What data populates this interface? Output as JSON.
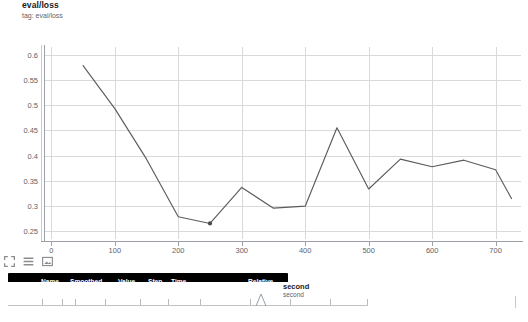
{
  "chart": {
    "title": "eval/loss",
    "subtitle": "tag: eval/loss"
  },
  "chart_data": {
    "type": "line",
    "title": "eval/loss",
    "subtitle": "tag: eval/loss",
    "xlabel": "",
    "ylabel": "",
    "xlim": [
      -10,
      740
    ],
    "ylim": [
      0.235,
      0.615
    ],
    "grid": true,
    "legend": false,
    "x_ticks": [
      0,
      100,
      200,
      300,
      400,
      500,
      600,
      700
    ],
    "y_ticks": [
      0.25,
      0.3,
      0.35,
      0.4,
      0.45,
      0.5,
      0.55,
      0.6
    ],
    "series": [
      {
        "name": "eval/loss",
        "color": "#5c5c5c",
        "x": [
          50,
          100,
          150,
          200,
          250,
          300,
          350,
          400,
          450,
          500,
          550,
          600,
          650,
          700,
          725
        ],
        "values": [
          0.578,
          0.493,
          0.393,
          0.279,
          0.2658,
          0.337,
          0.296,
          0.3,
          0.455,
          0.334,
          0.393,
          0.378,
          0.391,
          0.372,
          0.315
        ]
      }
    ],
    "highlight_point": {
      "x": 250,
      "y": 0.2658
    }
  },
  "tooltip": {
    "columns": [
      "Name",
      "Smoothed",
      "Value",
      "Step",
      "Time",
      "Relative"
    ],
    "row": {
      "name": "",
      "smoothed": "0.2658",
      "value": "0.2658",
      "step": "250",
      "time": "Sun Jun 27, 19:49:34",
      "relative": "2m 15s"
    }
  },
  "toolbar": {
    "buttons": [
      {
        "name": "expand-chart",
        "icon": "expand-icon"
      },
      {
        "name": "toggle-data-table",
        "icon": "lines-icon"
      },
      {
        "name": "download-image",
        "icon": "image-icon"
      }
    ]
  },
  "next_panel": {
    "title": "second",
    "subtitle": "second"
  },
  "colors": {
    "series": "#5c5c5c",
    "grid": "#d8d9db",
    "axis": "#9aa0a6",
    "tooltip_bg": "#000000",
    "text": "#3c4043"
  }
}
